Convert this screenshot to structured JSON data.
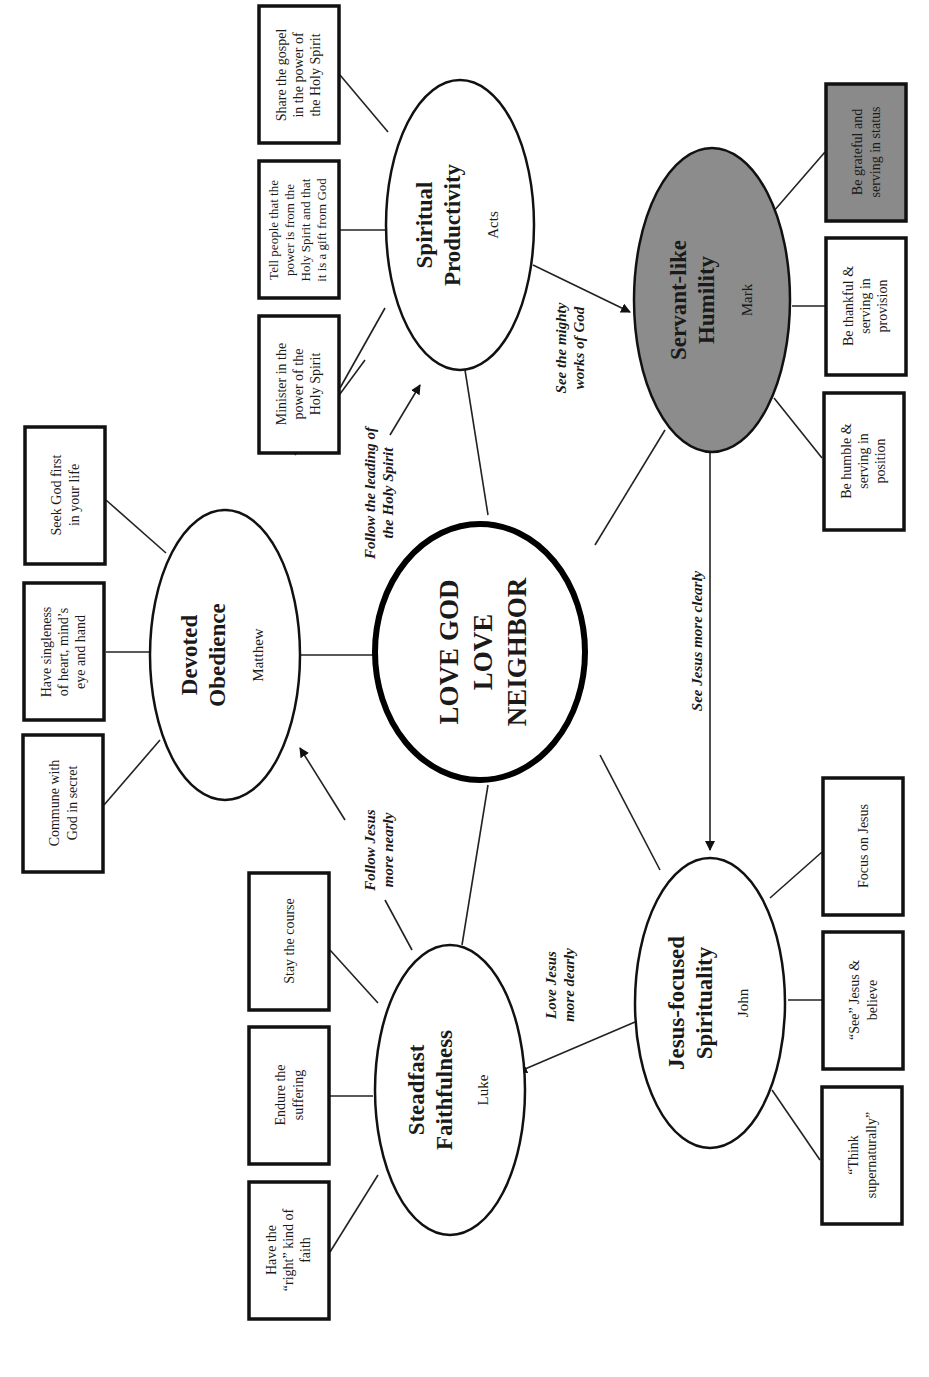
{
  "diagram": {
    "orientation": "rotated 90 degrees counter-clockwise",
    "center": {
      "line1": "LOVE GOD",
      "line2": "LOVE",
      "line3": "NEIGHBOR"
    },
    "nodes": [
      {
        "id": "devoted-obedience",
        "title_line1": "Devoted",
        "title_line2": "Obedience",
        "book": "Matthew",
        "shaded": false,
        "boxes": [
          {
            "lines": [
              "Seek God first",
              "in your life"
            ]
          },
          {
            "lines": [
              "Have singleness",
              "of heart, mind’s",
              "eye and hand"
            ]
          },
          {
            "lines": [
              "Commune with",
              "God in secret"
            ]
          }
        ]
      },
      {
        "id": "spiritual-productivity",
        "title_line1": "Spiritual",
        "title_line2": "Productivity",
        "book": "Acts",
        "shaded": false,
        "boxes": [
          {
            "lines": [
              "Share the gospel",
              "in the power of",
              "the Holy Spirit"
            ]
          },
          {
            "lines": [
              "Tell people that the",
              "power is from the",
              "Holy Spirit and that",
              "it is a gift from God"
            ]
          },
          {
            "lines": [
              "Minister in the",
              "power of the",
              "Holy Spirit"
            ]
          }
        ]
      },
      {
        "id": "servant-like-humility",
        "title_line1": "Servant-like",
        "title_line2": "Humility",
        "book": "Mark",
        "shaded": true,
        "boxes": [
          {
            "lines": [
              "Be grateful and",
              "serving in status"
            ],
            "shaded": true
          },
          {
            "lines": [
              "Be thankful &",
              "serving in",
              "provision"
            ]
          },
          {
            "lines": [
              "Be humble &",
              "serving in",
              "position"
            ]
          }
        ]
      },
      {
        "id": "jesus-focused-spirituality",
        "title_line1": "Jesus-focused",
        "title_line2": "Spirituality",
        "book": "John",
        "shaded": false,
        "boxes": [
          {
            "lines": [
              "Focus on Jesus"
            ]
          },
          {
            "lines": [
              "“See” Jesus &",
              "believe"
            ]
          },
          {
            "lines": [
              "“Think",
              "supernaturally”"
            ]
          }
        ]
      },
      {
        "id": "steadfast-faithfulness",
        "title_line1": "Steadfast",
        "title_line2": "Faithfulness",
        "book": "Luke",
        "shaded": false,
        "boxes": [
          {
            "lines": [
              "Stay the course"
            ]
          },
          {
            "lines": [
              "Endure the",
              "suffering"
            ]
          },
          {
            "lines": [
              "Have the",
              "“right” kind of",
              "faith"
            ]
          }
        ]
      }
    ],
    "edge_labels": {
      "follow_holy_spirit": [
        "Follow the leading of",
        "the Holy Spirit"
      ],
      "see_mighty_works": [
        "See the mighty",
        "works of God"
      ],
      "see_jesus_clearly": [
        "See Jesus more clearly"
      ],
      "love_jesus_dearly": [
        "Love Jesus",
        "more dearly"
      ],
      "follow_jesus_nearly": [
        "Follow Jesus",
        "more nearly"
      ]
    },
    "colors": {
      "shaded_fill": "#8c8c8c",
      "stroke": "#111111",
      "background": "#ffffff"
    }
  }
}
